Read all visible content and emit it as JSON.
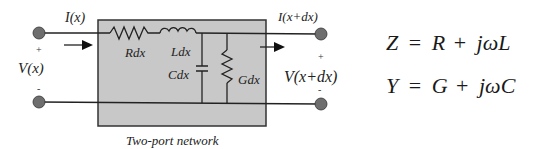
{
  "diagram": {
    "box": {
      "caption": "Two-port network",
      "fill": "#c8c8c8",
      "stroke": "#333333"
    },
    "left_port": {
      "current_label": "I(x)",
      "voltage_label": "V(x)",
      "plus": "+",
      "minus": "-"
    },
    "right_port": {
      "current_label": "I(x+dx)",
      "voltage_label": "V(x+dx)",
      "plus": "+",
      "minus": "-"
    },
    "components": {
      "resistor_series": "Rdx",
      "inductor_series": "Ldx",
      "capacitor_shunt": "Cdx",
      "conductance_shunt": "Gdx"
    },
    "terminal_color": "#6e6e6e",
    "wire_color": "#222222"
  },
  "equations": {
    "impedance": {
      "lhs": "Z",
      "eq": "=",
      "t1": "R",
      "plus": "+",
      "t2": "jωL"
    },
    "admittance": {
      "lhs": "Y",
      "eq": "=",
      "t1": "G",
      "plus": "+",
      "t2": "jωC"
    }
  }
}
